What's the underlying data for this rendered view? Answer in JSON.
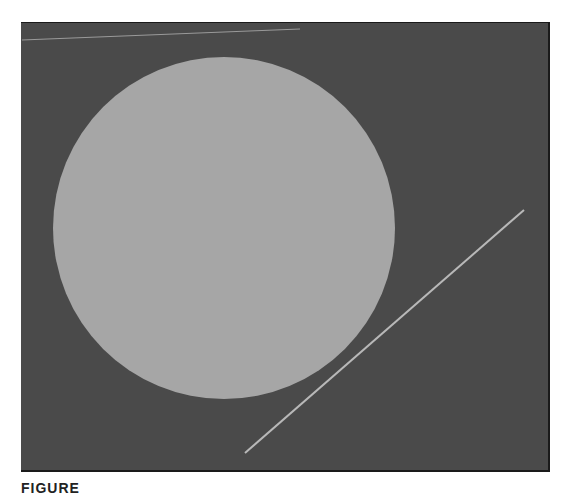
{
  "figure": {
    "background_color": "#4a4a4a",
    "disc": {
      "color": "#a6a6a6",
      "cx": 224,
      "cy": 228,
      "r": 171
    },
    "lines": [
      {
        "name": "top-faint-line",
        "x1": 22,
        "y1": 40,
        "x2": 300,
        "y2": 29,
        "color": "#9a9a9a"
      },
      {
        "name": "diagonal-line",
        "x1": 245,
        "y1": 453,
        "x2": 524,
        "y2": 210,
        "color": "#b8b8b8"
      }
    ],
    "caption": "FIGURE"
  }
}
